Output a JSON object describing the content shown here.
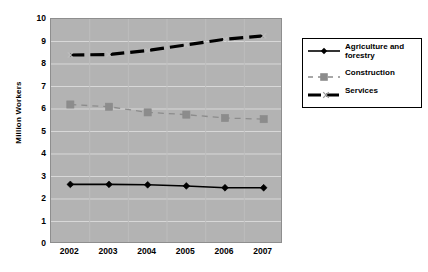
{
  "chart_data": {
    "type": "line",
    "title": "",
    "xlabel": "",
    "ylabel": "Million Workers",
    "categories": [
      "2002",
      "2003",
      "2004",
      "2005",
      "2006",
      "2007"
    ],
    "ylim": [
      0,
      10
    ],
    "ytick_values": [
      "10",
      "9",
      "8",
      "7",
      "6",
      "5",
      "4",
      "3",
      "2",
      "1",
      "0"
    ],
    "grid": "horizontal",
    "legend_position": "right",
    "plot_background": "#b3b3b3",
    "series": [
      {
        "name": "Agriculture and forestry",
        "values": [
          2.65,
          2.65,
          2.63,
          2.58,
          2.5,
          2.5
        ],
        "color": "#000000",
        "marker": "diamond",
        "line_style": "solid",
        "line_width": 1.6
      },
      {
        "name": "Construction",
        "values": [
          6.2,
          6.1,
          5.85,
          5.75,
          5.6,
          5.55
        ],
        "color": "#8c8c8c",
        "marker": "square",
        "line_style": "dashed",
        "line_width": 1.3
      },
      {
        "name": "Services",
        "values": [
          8.4,
          8.42,
          8.6,
          8.85,
          9.1,
          9.25
        ],
        "color": "#000000",
        "marker": "x",
        "line_style": "dashed",
        "line_width": 3.2
      }
    ]
  },
  "legend": {
    "entries": [
      {
        "label_line1": "Agriculture  and",
        "label_line2": "forestry"
      },
      {
        "label_line1": "Construction",
        "label_line2": ""
      },
      {
        "label_line1": "Services",
        "label_line2": ""
      }
    ]
  }
}
